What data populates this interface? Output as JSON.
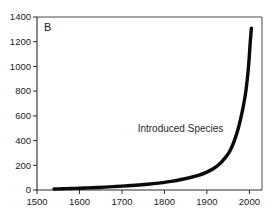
{
  "figure": {
    "panel_label": "B",
    "background_color": "#ffffff"
  },
  "chart_data": {
    "type": "line",
    "title": "",
    "subtitle": "",
    "panel_label": "B",
    "xlabel": "",
    "ylabel": "",
    "xlim": [
      1500,
      2030
    ],
    "ylim": [
      0,
      1400
    ],
    "xticks": [
      1500,
      1600,
      1700,
      1800,
      1900,
      2000
    ],
    "xtick_labels": [
      "1500",
      "1600",
      "1700",
      "1800",
      "1900",
      "2000"
    ],
    "yticks": [
      0,
      200,
      400,
      600,
      800,
      1000,
      1200,
      1400
    ],
    "ytick_labels": [
      "0",
      "200",
      "400",
      "600",
      "800",
      "1000",
      "1200",
      "1400"
    ],
    "grid": false,
    "legend_position": "none",
    "annotations": [
      {
        "text": "Introduced Species",
        "x": 1838,
        "y": 500
      }
    ],
    "series": [
      {
        "name": "Introduced Species",
        "color": "#0a0a0a",
        "line_width": 3.4,
        "x": [
          1540,
          1560,
          1580,
          1600,
          1620,
          1640,
          1660,
          1680,
          1700,
          1720,
          1740,
          1760,
          1780,
          1800,
          1820,
          1840,
          1860,
          1880,
          1900,
          1915,
          1930,
          1945,
          1955,
          1965,
          1975,
          1985,
          1992,
          1998,
          2002,
          2005
        ],
        "values": [
          8,
          10,
          12,
          14,
          17,
          20,
          23,
          27,
          31,
          36,
          41,
          47,
          54,
          62,
          72,
          85,
          100,
          118,
          145,
          172,
          210,
          268,
          320,
          400,
          510,
          660,
          800,
          990,
          1180,
          1310
        ]
      }
    ]
  },
  "axes": {
    "left_axis_name": "y-axis",
    "bottom_axis_name": "x-axis"
  }
}
